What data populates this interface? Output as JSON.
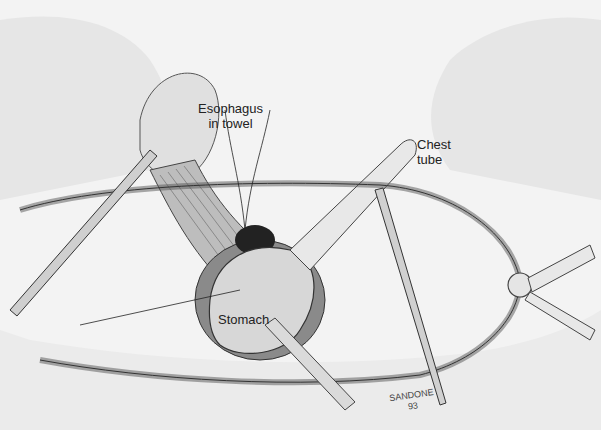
{
  "illustration": {
    "type": "surgical-illustration",
    "labels": {
      "esophagus_line1": "Esophagus",
      "esophagus_line2": "in towel",
      "chest_line1": "Chest",
      "chest_line2": "tube",
      "stomach": "Stomach"
    },
    "signature": {
      "name": "SANDONE",
      "year": "93"
    }
  }
}
